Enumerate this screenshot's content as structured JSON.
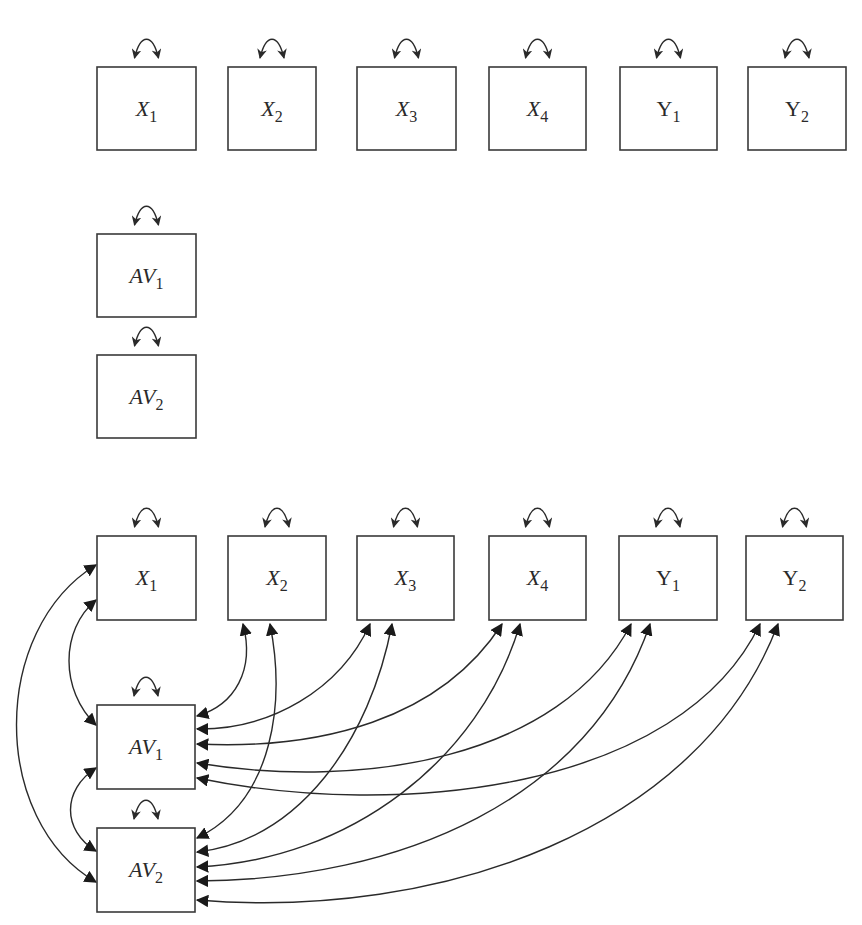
{
  "diagram": {
    "type": "path-diagram",
    "panels": [
      {
        "name": "unconnected-model",
        "nodes": [
          {
            "id": "X1",
            "base": "X",
            "sub": "1",
            "x": 97,
            "y": 67,
            "w": 99,
            "h": 83
          },
          {
            "id": "X2",
            "base": "X",
            "sub": "2",
            "x": 228,
            "y": 67,
            "w": 88,
            "h": 83
          },
          {
            "id": "X3",
            "base": "X",
            "sub": "3",
            "x": 357,
            "y": 67,
            "w": 99,
            "h": 83
          },
          {
            "id": "X4",
            "base": "X",
            "sub": "4",
            "x": 489,
            "y": 67,
            "w": 97,
            "h": 83
          },
          {
            "id": "Y1",
            "base": "Y",
            "sub": "1",
            "x": 620,
            "y": 67,
            "w": 97,
            "h": 83
          },
          {
            "id": "Y2",
            "base": "Y",
            "sub": "2",
            "x": 748,
            "y": 67,
            "w": 98,
            "h": 83
          },
          {
            "id": "AV1",
            "base": "AV",
            "sub": "1",
            "x": 97,
            "y": 234,
            "w": 99,
            "h": 83
          },
          {
            "id": "AV2",
            "base": "AV",
            "sub": "2",
            "x": 97,
            "y": 355,
            "w": 99,
            "h": 83
          }
        ],
        "covariances": []
      },
      {
        "name": "auxiliary-variable-model",
        "nodes": [
          {
            "id": "X1",
            "base": "X",
            "sub": "1",
            "x": 97,
            "y": 536,
            "w": 99,
            "h": 84
          },
          {
            "id": "X2",
            "base": "X",
            "sub": "2",
            "x": 228,
            "y": 536,
            "w": 98,
            "h": 84
          },
          {
            "id": "X3",
            "base": "X",
            "sub": "3",
            "x": 357,
            "y": 536,
            "w": 97,
            "h": 84
          },
          {
            "id": "X4",
            "base": "X",
            "sub": "4",
            "x": 489,
            "y": 536,
            "w": 97,
            "h": 84
          },
          {
            "id": "Y1",
            "base": "Y",
            "sub": "1",
            "x": 619,
            "y": 536,
            "w": 98,
            "h": 84
          },
          {
            "id": "Y2",
            "base": "Y",
            "sub": "2",
            "x": 746,
            "y": 536,
            "w": 97,
            "h": 84
          },
          {
            "id": "AV1",
            "base": "AV",
            "sub": "1",
            "x": 97,
            "y": 705,
            "w": 98,
            "h": 84
          },
          {
            "id": "AV2",
            "base": "AV",
            "sub": "2",
            "x": 97,
            "y": 828,
            "w": 98,
            "h": 84
          }
        ],
        "covariances": [
          {
            "from": "X1",
            "to": "AV1"
          },
          {
            "from": "X1",
            "to": "AV2"
          },
          {
            "from": "AV1",
            "to": "AV2"
          },
          {
            "from": "X2",
            "to": "AV1"
          },
          {
            "from": "X2",
            "to": "AV2"
          },
          {
            "from": "X3",
            "to": "AV1"
          },
          {
            "from": "X3",
            "to": "AV2"
          },
          {
            "from": "X4",
            "to": "AV1"
          },
          {
            "from": "X4",
            "to": "AV2"
          },
          {
            "from": "Y1",
            "to": "AV1"
          },
          {
            "from": "Y1",
            "to": "AV2"
          },
          {
            "from": "Y2",
            "to": "AV1"
          },
          {
            "from": "Y2",
            "to": "AV2"
          }
        ]
      }
    ],
    "variance_arrow": "double-headed-curved-arrow",
    "colors": {
      "stroke": "#2a2a2a",
      "box_border": "#3a3a3a",
      "background": "#ffffff"
    }
  }
}
